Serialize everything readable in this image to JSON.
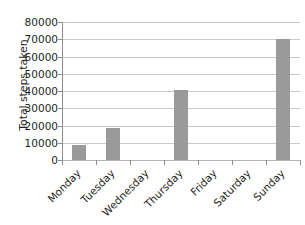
{
  "chart_data": {
    "type": "bar",
    "title": "",
    "subtitle": "",
    "xlabel": "",
    "ylabel": "Total steps taken",
    "categories": [
      "Monday",
      "Tuesday",
      "Wednesday",
      "Thursday",
      "Friday",
      "Saturday",
      "Sunday"
    ],
    "values": [
      8500,
      18500,
      0,
      40500,
      0,
      0,
      70000
    ],
    "ylim": [
      0,
      80000
    ],
    "ytick_values": [
      0,
      10000,
      20000,
      30000,
      40000,
      50000,
      60000,
      70000,
      80000
    ],
    "ytick_labels": [
      "0",
      "10000",
      "20000",
      "30000",
      "40000",
      "50000",
      "60000",
      "70000",
      "80000"
    ],
    "grid": true,
    "grid_axis": "y",
    "legend": false,
    "legend_position": "none",
    "bar_color": "#9a9a9a",
    "gridline_color": "#c8c8c8",
    "axis_color": "#8c8c8c",
    "text_color": "#231f20",
    "background_color": "#ffffff",
    "xtick_label_rotation": -45
  }
}
